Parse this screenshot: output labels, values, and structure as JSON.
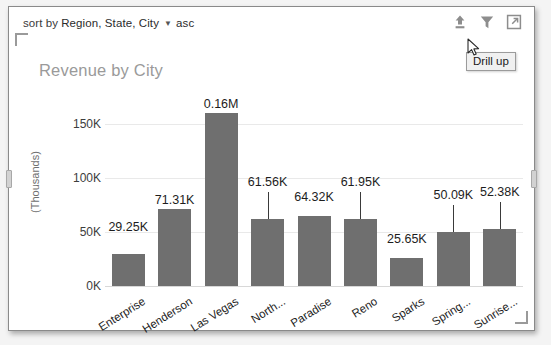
{
  "sort_bar": {
    "label": "sort by",
    "fields": "Region, State, City",
    "caret_icon": "chevron-down-icon",
    "direction": "asc"
  },
  "toolbar": {
    "items": [
      {
        "name": "drill-up-icon",
        "title": "Drill up"
      },
      {
        "name": "filter-icon",
        "title": "Filters"
      },
      {
        "name": "focus-mode-icon",
        "title": "Focus mode"
      }
    ]
  },
  "tooltip": {
    "text": "Drill up"
  },
  "chart_data": {
    "type": "bar",
    "title": "Revenue by City",
    "xlabel": "",
    "ylabel": "(Thousands)",
    "ylim": [
      0,
      170
    ],
    "yticks": [
      "0K",
      "50K",
      "100K",
      "150K"
    ],
    "ytick_values": [
      0,
      50,
      100,
      150
    ],
    "grid": true,
    "legend": "none",
    "categories": [
      "Enterprise",
      "Henderson",
      "Las Vegas",
      "North...",
      "Paradise",
      "Reno",
      "Sparks",
      "Spring...",
      "Sunrise..."
    ],
    "values": [
      29.25,
      71.31,
      160.0,
      61.56,
      64.32,
      61.95,
      25.65,
      50.09,
      52.38
    ],
    "data_labels": [
      "29.25K",
      "71.31K",
      "0.16M",
      "61.56K",
      "64.32K",
      "61.95K",
      "25.65K",
      "50.09K",
      "52.38K"
    ],
    "colors": {
      "bar": "#6f6f6f",
      "gridline": "#e9e9e9",
      "title": "#9a9a9a",
      "label": "#1d1d1d"
    }
  }
}
